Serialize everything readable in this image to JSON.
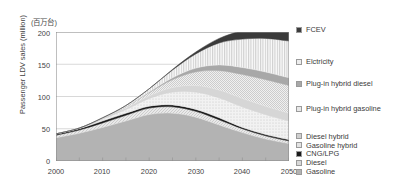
{
  "chart_data": {
    "type": "area",
    "stacked": true,
    "title": "",
    "unit_note": "(百万台)",
    "xlabel": "",
    "ylabel": "Passenger LDV sales (million)",
    "x": [
      2000,
      2005,
      2010,
      2015,
      2020,
      2025,
      2030,
      2035,
      2040,
      2045,
      2050
    ],
    "xlim": [
      2000,
      2050
    ],
    "ylim": [
      0,
      200
    ],
    "xticks": [
      "2000",
      "2010",
      "2020",
      "2030",
      "2040",
      "2050"
    ],
    "yticks": [
      "0",
      "50",
      "100",
      "150",
      "200"
    ],
    "grid": "horizontal",
    "legend_position": "right",
    "series": [
      {
        "name": "Gasoline",
        "color": "#b3b3b3",
        "pattern": "solid",
        "values": [
          36,
          43,
          52,
          62,
          72,
          74,
          68,
          56,
          44,
          34,
          27
        ]
      },
      {
        "name": "Diesel",
        "color": "#d8d8d8",
        "pattern": "fine-hatch",
        "values": [
          4,
          5,
          7,
          9,
          10,
          10,
          9,
          8,
          6,
          5,
          4
        ]
      },
      {
        "name": "CNG/LPG",
        "color": "#1a1a1a",
        "pattern": "solid",
        "values": [
          2,
          2,
          3,
          3,
          3,
          3,
          3,
          3,
          2,
          2,
          2
        ]
      },
      {
        "name": "Gasoline hybrid",
        "color": "#e3e3e3",
        "pattern": "dotted",
        "values": [
          0,
          1,
          3,
          6,
          12,
          20,
          27,
          31,
          32,
          31,
          29
        ]
      },
      {
        "name": "Diesel hybrid",
        "color": "#cfcfcf",
        "pattern": "light",
        "values": [
          0,
          0,
          1,
          2,
          4,
          7,
          10,
          12,
          13,
          13,
          12
        ]
      },
      {
        "name": "Plug-in hybrid gasoline",
        "color": "#e8e8e8",
        "pattern": "checker",
        "values": [
          0,
          0,
          0,
          2,
          5,
          12,
          21,
          30,
          37,
          41,
          43
        ]
      },
      {
        "name": "Plug-in hybrid diesel",
        "color": "#a8a8a8",
        "pattern": "solid",
        "values": [
          0,
          0,
          0,
          0,
          1,
          3,
          6,
          9,
          11,
          12,
          12
        ]
      },
      {
        "name": "Elctricity",
        "color": "#ededed",
        "pattern": "vstripe",
        "values": [
          0,
          0,
          1,
          2,
          5,
          12,
          22,
          34,
          44,
          52,
          57
        ]
      },
      {
        "name": "FCEV",
        "color": "#3b3b3b",
        "pattern": "solid",
        "values": [
          0,
          0,
          0,
          0,
          0,
          1,
          3,
          7,
          13,
          19,
          24
        ]
      }
    ],
    "totals": [
      42,
      51,
      67,
      86,
      112,
      142,
      169,
      190,
      202,
      209,
      210
    ]
  },
  "axes": {
    "unit": "(百万台)",
    "y_title": "Passenger LDV sales (million)",
    "y_ticks": [
      "200",
      "150",
      "100",
      "50",
      "0"
    ],
    "x_ticks": [
      "2000",
      "2010",
      "2020",
      "2030",
      "2040",
      "2050"
    ]
  },
  "legend": {
    "items": [
      {
        "label": "FCEV",
        "swatch": "#3b3b3b"
      },
      {
        "label": "Elctricity",
        "swatch": "#ededed"
      },
      {
        "label": "Plug-in hybrid diesel",
        "swatch": "#a8a8a8"
      },
      {
        "label": "Plug-in hybrid gasoline",
        "swatch": "#e8e8e8"
      },
      {
        "label": "Diesel hybrid",
        "swatch": "#cfcfcf"
      },
      {
        "label": "Gasoline hybrid",
        "swatch": "#e3e3e3"
      },
      {
        "label": "CNG/LPG",
        "swatch": "#1a1a1a"
      },
      {
        "label": "Diesel",
        "swatch": "#d8d8d8"
      },
      {
        "label": "Gasoline",
        "swatch": "#b3b3b3"
      }
    ]
  }
}
